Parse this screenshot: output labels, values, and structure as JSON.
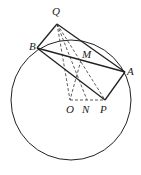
{
  "diagram": {
    "circle": {
      "center": "O",
      "cx": 71,
      "cy": 100,
      "r": 60
    },
    "points": {
      "Q": {
        "label": "Q",
        "x": 57,
        "y": 24
      },
      "B": {
        "label": "B",
        "x": 37,
        "y": 48
      },
      "A": {
        "label": "A",
        "x": 125,
        "y": 72
      },
      "P": {
        "label": "P",
        "x": 105,
        "y": 100
      },
      "M": {
        "label": "M",
        "x": 81,
        "y": 60
      },
      "O": {
        "label": "O",
        "x": 70,
        "y": 100
      },
      "N": {
        "label": "N",
        "x": 87,
        "y": 100
      }
    },
    "solid_segments": [
      "QB",
      "QA",
      "BA",
      "BP",
      "AP"
    ],
    "dashed_segments": [
      "QO",
      "QN",
      "QP",
      "MO",
      "MN",
      "OP"
    ],
    "arc_BA_inner": true
  }
}
